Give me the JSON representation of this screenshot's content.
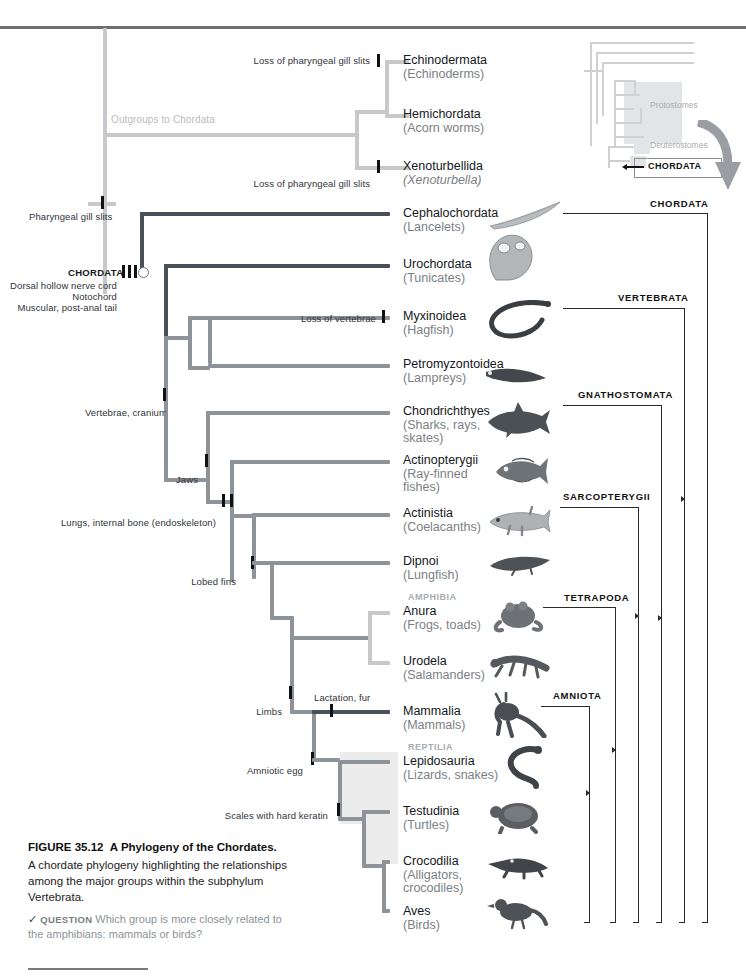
{
  "figure": {
    "number": "FIGURE 35.12",
    "title": "A Phylogeny of the Chordates.",
    "body": "A chordate phylogeny highlighting the relationships among the major groups within the subphylum Vertebrata.",
    "question_tag": "QUESTION",
    "question": "Which group is more closely related to the amphibians: mammals or birds?",
    "check_glyph": "✓"
  },
  "inset": {
    "protostomes": "Protostomes",
    "deuterostomes": "Deuterostomes",
    "chordata": "CHORDATA",
    "chordata_callout": "CHORDATA"
  },
  "outgroup_label": "Outgroups to Chordata",
  "root_node": {
    "name": "CHORDATA",
    "synapomorphies": [
      "Dorsal hollow nerve cord",
      "Notochord",
      "Muscular, post-anal tail"
    ]
  },
  "synapomorphies": [
    {
      "id": "pharyngeal-gill-slits",
      "label": "Pharyngeal gill slits"
    },
    {
      "id": "loss-gill-slits-echino",
      "label": "Loss of pharyngeal gill slits"
    },
    {
      "id": "loss-gill-slits-xeno",
      "label": "Loss of pharyngeal gill slits"
    },
    {
      "id": "loss-of-vertebrae",
      "label": "Loss of vertebrae"
    },
    {
      "id": "vertebrae-cranium",
      "label": "Vertebrae, cranium"
    },
    {
      "id": "jaws",
      "label": "Jaws"
    },
    {
      "id": "lungs-internal-bone",
      "label": "Lungs, internal bone (endoskeleton)"
    },
    {
      "id": "lobed-fins",
      "label": "Lobed fins"
    },
    {
      "id": "limbs",
      "label": "Limbs"
    },
    {
      "id": "lactation-fur",
      "label": "Lactation, fur"
    },
    {
      "id": "amniotic-egg",
      "label": "Amniotic egg"
    },
    {
      "id": "scales-hard-keratin",
      "label": "Scales with hard keratin"
    }
  ],
  "group_headers": [
    {
      "id": "amphibia",
      "label": "AMPHIBIA"
    },
    {
      "id": "reptilia",
      "label": "REPTILIA"
    }
  ],
  "taxa": [
    {
      "id": "echinodermata",
      "name": "Echinodermata",
      "common": "(Echinoderms)",
      "italic": false
    },
    {
      "id": "hemichordata",
      "name": "Hemichordata",
      "common": "(Acorn worms)",
      "italic": false
    },
    {
      "id": "xenoturbellida",
      "name": "Xenoturbellida",
      "common": "(Xenoturbella)",
      "italic": true
    },
    {
      "id": "cephalochordata",
      "name": "Cephalochordata",
      "common": "(Lancelets)",
      "italic": false
    },
    {
      "id": "urochordata",
      "name": "Urochordata",
      "common": "(Tunicates)",
      "italic": false
    },
    {
      "id": "myxinoidea",
      "name": "Myxinoidea",
      "common": "(Hagfish)",
      "italic": false
    },
    {
      "id": "petromyzontoidea",
      "name": "Petromyzontoidea",
      "common": "(Lampreys)",
      "italic": false
    },
    {
      "id": "chondrichthyes",
      "name": "Chondrichthyes",
      "common": "(Sharks, rays, skates)",
      "italic": false
    },
    {
      "id": "actinopterygii",
      "name": "Actinopterygii",
      "common": "(Ray-finned fishes)",
      "italic": false
    },
    {
      "id": "actinistia",
      "name": "Actinistia",
      "common": "(Coelacanths)",
      "italic": false
    },
    {
      "id": "dipnoi",
      "name": "Dipnoi",
      "common": "(Lungfish)",
      "italic": false
    },
    {
      "id": "anura",
      "name": "Anura",
      "common": "(Frogs, toads)",
      "italic": false
    },
    {
      "id": "urodela",
      "name": "Urodela",
      "common": "(Salamanders)",
      "italic": false
    },
    {
      "id": "mammalia",
      "name": "Mammalia",
      "common": "(Mammals)",
      "italic": false
    },
    {
      "id": "lepidosauria",
      "name": "Lepidosauria",
      "common": "(Lizards, snakes)",
      "italic": false
    },
    {
      "id": "testudinia",
      "name": "Testudinia",
      "common": "(Turtles)",
      "italic": false
    },
    {
      "id": "crocodilia",
      "name": "Crocodilia",
      "common": "(Alligators, crocodiles)",
      "italic": false
    },
    {
      "id": "aves",
      "name": "Aves",
      "common": "(Birds)",
      "italic": false
    }
  ],
  "clades": [
    {
      "id": "chordata",
      "label": "CHORDATA"
    },
    {
      "id": "vertebrata",
      "label": "VERTEBRATA"
    },
    {
      "id": "gnathostomata",
      "label": "GNATHOSTOMATA"
    },
    {
      "id": "sarcopterygii",
      "label": "SARCOPTERYGII"
    },
    {
      "id": "tetrapoda",
      "label": "TETRAPODA"
    },
    {
      "id": "amniota",
      "label": "AMNIOTA"
    }
  ],
  "colors": {
    "tree_dark": "#595f66",
    "tree_mid": "#8e9399",
    "tree_pale": "#c6c8ca",
    "text_primary": "#15181c",
    "text_muted": "#7b7f85",
    "shade": "#ececec",
    "bracket": "#2a2a2a"
  }
}
